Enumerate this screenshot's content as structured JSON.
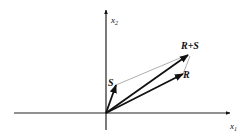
{
  "diagram": {
    "axes": {
      "x_label": "x",
      "x_subscript": "1",
      "y_label": "x",
      "y_subscript": "2"
    },
    "vectors": [
      {
        "name": "S",
        "label": "S"
      },
      {
        "name": "R",
        "label": "R"
      },
      {
        "name": "R+S",
        "label": "R+S"
      }
    ],
    "colors": {
      "axis": "#111111",
      "vector": "#111111",
      "construction_line": "#9a9a9a"
    }
  }
}
